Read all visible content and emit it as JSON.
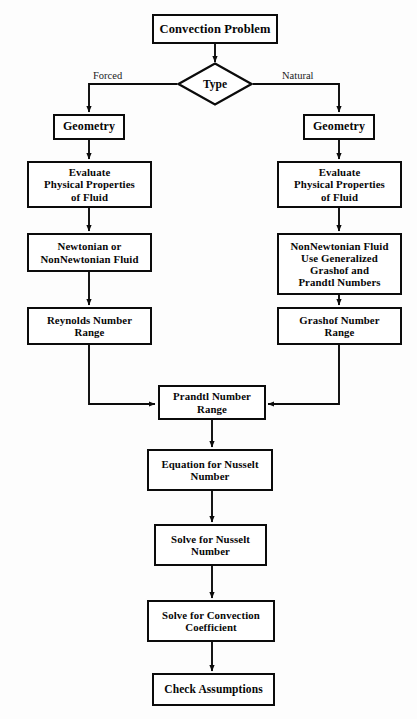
{
  "figure": {
    "type": "flowchart",
    "orientation": "top-to-bottom with two parallel branches merging",
    "nodes": {
      "start": "Convection Problem",
      "decision": "Type",
      "geometry_forced": "Geometry",
      "geometry_natural": "Geometry",
      "evaluate_forced_l1": "Evaluate",
      "evaluate_forced_l2": "Physical Properties",
      "evaluate_forced_l3": "of Fluid",
      "evaluate_natural_l1": "Evaluate",
      "evaluate_natural_l2": "Physical Properties",
      "evaluate_natural_l3": "of Fluid",
      "fluid_forced_l1": "Newtonian or",
      "fluid_forced_l2": "NonNewtonian Fluid",
      "fluid_natural_l1": "NonNewtonian Fluid",
      "fluid_natural_l2": "Use Generalized",
      "fluid_natural_l3": "Grashof and",
      "fluid_natural_l4": "Prandtl Numbers",
      "reynolds_l1": "Reynolds Number",
      "reynolds_l2": "Range",
      "grashof_l1": "Grashof Number",
      "grashof_l2": "Range",
      "prandtl_l1": "Prandtl Number",
      "prandtl_l2": "Range",
      "equation_l1": "Equation for Nusselt",
      "equation_l2": "Number",
      "solve_nusselt_l1": "Solve for Nusselt",
      "solve_nusselt_l2": "Number",
      "solve_convection_l1": "Solve for Convection",
      "solve_convection_l2": "Coefficient",
      "check": "Check Assumptions"
    },
    "edge_labels": {
      "forced": "Forced",
      "natural": "Natural"
    },
    "colors": {
      "ink": "#0b0b0b",
      "background": "#ffffff",
      "label_text": "#1b1b1b"
    }
  }
}
